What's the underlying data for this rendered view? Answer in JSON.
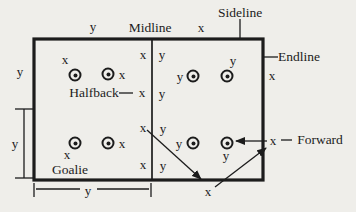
{
  "figure": {
    "background": "#efeeea",
    "ink": "#1c1c1c",
    "labels": {
      "midline": "Midline",
      "sideline": "Sideline",
      "endline": "Endline",
      "halfback": "Halfback",
      "goalie": "Goalie",
      "forward": "Forward"
    },
    "field": {
      "x": 34,
      "y": 39,
      "width": 229,
      "height": 141,
      "midline_x": 152
    },
    "positions": [
      {
        "x": 75,
        "y": 75
      },
      {
        "x": 108,
        "y": 74
      },
      {
        "x": 193,
        "y": 76
      },
      {
        "x": 227,
        "y": 76
      },
      {
        "x": 75,
        "y": 143
      },
      {
        "x": 108,
        "y": 143
      },
      {
        "x": 193,
        "y": 143
      },
      {
        "x": 227,
        "y": 143
      }
    ],
    "letter_markers": [
      {
        "glyph": "y",
        "x": 93,
        "y": 26
      },
      {
        "glyph": "x",
        "x": 201,
        "y": 27
      },
      {
        "glyph": "y",
        "x": 20,
        "y": 71
      },
      {
        "glyph": "x",
        "x": 272,
        "y": 75
      },
      {
        "glyph": "x",
        "x": 65,
        "y": 59
      },
      {
        "glyph": "x",
        "x": 122,
        "y": 74
      },
      {
        "glyph": "x",
        "x": 143,
        "y": 54
      },
      {
        "glyph": "y",
        "x": 162,
        "y": 54
      },
      {
        "glyph": "y",
        "x": 180,
        "y": 76
      },
      {
        "glyph": "y",
        "x": 233,
        "y": 60
      },
      {
        "glyph": "x",
        "x": 142,
        "y": 92
      },
      {
        "glyph": "y",
        "x": 162,
        "y": 93
      },
      {
        "glyph": "x",
        "x": 143,
        "y": 127
      },
      {
        "glyph": "y",
        "x": 163,
        "y": 128
      },
      {
        "glyph": "x",
        "x": 67,
        "y": 154
      },
      {
        "glyph": "x",
        "x": 122,
        "y": 143
      },
      {
        "glyph": "x",
        "x": 143,
        "y": 164
      },
      {
        "glyph": "y",
        "x": 163,
        "y": 165
      },
      {
        "glyph": "y",
        "x": 179,
        "y": 143
      },
      {
        "glyph": "y",
        "x": 226,
        "y": 155
      },
      {
        "glyph": "x",
        "x": 273,
        "y": 140
      },
      {
        "glyph": "x",
        "x": 208,
        "y": 191
      },
      {
        "glyph": "y",
        "x": 15,
        "y": 143
      },
      {
        "glyph": "y",
        "x": 88,
        "y": 190
      }
    ],
    "lines": [
      {
        "name": "sideline-pointer",
        "x1": 240,
        "y1": 19,
        "x2": 240,
        "y2": 38
      },
      {
        "name": "endline-pointer",
        "x1": 263,
        "y1": 57,
        "x2": 278,
        "y2": 57
      },
      {
        "name": "halfback-pointer",
        "x1": 119,
        "y1": 93,
        "x2": 133,
        "y2": 93
      },
      {
        "name": "forward-pointer",
        "x1": 281,
        "y1": 140,
        "x2": 292,
        "y2": 140
      },
      {
        "name": "left-bracket-top-tick",
        "x1": 15,
        "y1": 109,
        "x2": 33,
        "y2": 109
      },
      {
        "name": "left-bracket-bottom-tick",
        "x1": 15,
        "y1": 178,
        "x2": 33,
        "y2": 178
      },
      {
        "name": "left-bracket-line",
        "x1": 24,
        "y1": 109,
        "x2": 24,
        "y2": 178
      },
      {
        "name": "bottom-bracket-left-tick",
        "x1": 34,
        "y1": 183,
        "x2": 34,
        "y2": 197
      },
      {
        "name": "bottom-bracket-right-tick",
        "x1": 151,
        "y1": 183,
        "x2": 151,
        "y2": 197
      },
      {
        "name": "bottom-bracket-line-left",
        "x1": 36,
        "y1": 189,
        "x2": 80,
        "y2": 189
      },
      {
        "name": "bottom-bracket-line-right",
        "x1": 97,
        "y1": 189,
        "x2": 149,
        "y2": 189
      }
    ],
    "arrows": [
      {
        "name": "forward-arrow",
        "x1": 267,
        "y1": 141,
        "x2": 236,
        "y2": 141
      },
      {
        "name": "diagonal-arrow-down",
        "x1": 147,
        "y1": 130,
        "x2": 201,
        "y2": 179
      },
      {
        "name": "diagonal-arrow-up",
        "x1": 215,
        "y1": 187,
        "x2": 266,
        "y2": 148
      }
    ]
  }
}
